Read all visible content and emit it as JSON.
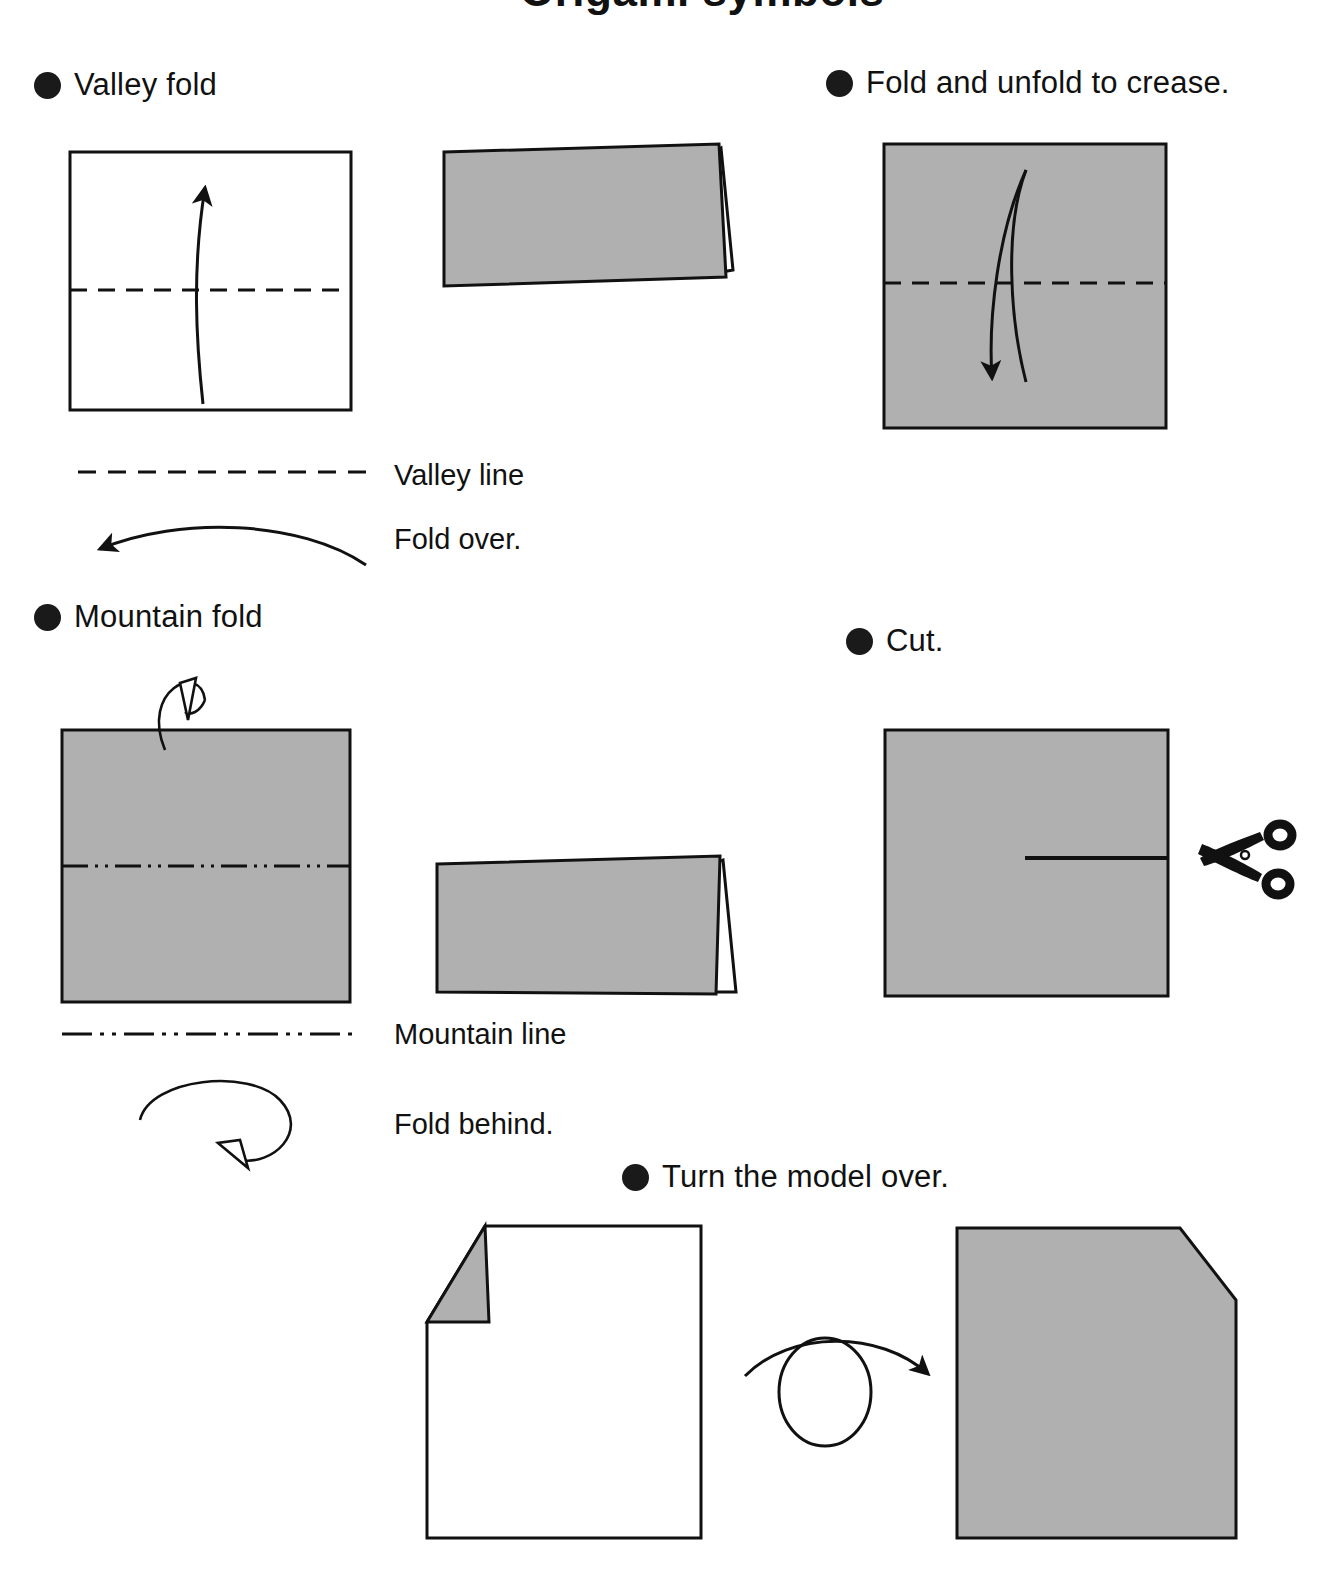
{
  "page": {
    "title_partial": "Origami symbols",
    "background_color": "#ffffff",
    "paper_gray": "#b0b0b0",
    "ink_color": "#111111"
  },
  "sections": {
    "valley_fold": {
      "bullet": "filled-circle",
      "caption": "Valley fold",
      "before_shape": "white-square-with-valley-crease",
      "after_shape": "gray-folded-rectangle-with-flap",
      "arrow": "curved-up-arrow"
    },
    "fold_and_unfold": {
      "bullet": "filled-circle",
      "caption": "Fold and unfold to crease.",
      "shape": "gray-square-with-valley-crease",
      "arrow": "double-curved-up-down-arrow"
    },
    "mountain_fold": {
      "bullet": "filled-circle",
      "caption": "Mountain fold",
      "before_shape": "gray-square-with-mountain-crease",
      "after_shape": "gray-folded-rectangle-with-flap",
      "arrow": "loop-over-hollow-arrow"
    },
    "cut": {
      "bullet": "filled-circle",
      "caption": "Cut.",
      "shape": "gray-square-with-cut-line",
      "tool": "scissors-icon"
    },
    "turn_over": {
      "bullet": "filled-circle",
      "caption": "Turn the model over.",
      "before_shape": "white-square-with-gray-folded-corner",
      "after_shape": "gray-square-with-chamfered-corner",
      "arrow": "flip-loop-arrow"
    }
  },
  "legend": [
    {
      "key": "valley_line",
      "label": "Valley line",
      "line_style": "dashed"
    },
    {
      "key": "fold_over",
      "label": "Fold over.",
      "line_style": "curved-arrow-left"
    },
    {
      "key": "mountain_line",
      "label": "Mountain line",
      "line_style": "dash-dot-dot"
    },
    {
      "key": "fold_behind",
      "label": "Fold behind.",
      "line_style": "loop-arrow-hollow"
    }
  ]
}
